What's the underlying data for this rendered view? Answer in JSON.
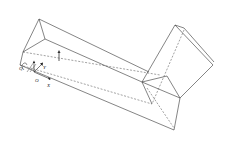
{
  "diagram": {
    "type": "isometric line drawing of an L-shaped rectangular box with coordinate axes",
    "labels": {
      "origin": "O",
      "x_axis": "X",
      "y_axis": "Y",
      "rotation": "Q"
    },
    "colors": {
      "line": "#333333",
      "background": "#ffffff"
    }
  }
}
